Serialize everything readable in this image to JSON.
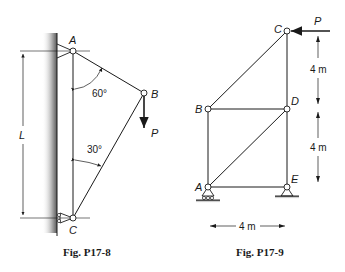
{
  "figures": [
    {
      "caption": "Fig. P17-8",
      "nodes": {
        "A": "A",
        "B": "B",
        "C": "C"
      },
      "load_label": "P",
      "angles": {
        "top": "60°",
        "bottom": "30°"
      },
      "dimension": "L"
    },
    {
      "caption": "Fig. P17-9",
      "nodes": {
        "A": "A",
        "B": "B",
        "C": "C",
        "D": "D",
        "E": "E"
      },
      "load_label": "P",
      "dimensions": {
        "upper": "4 m",
        "lower": "4 m",
        "horizontal": "4 m"
      }
    }
  ]
}
